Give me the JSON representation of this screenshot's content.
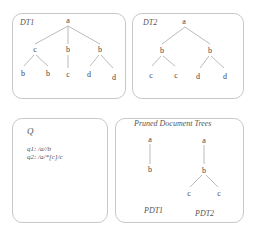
{
  "dt1": {
    "title": "DT1",
    "nodes": {
      "root": "a",
      "l": "c",
      "m": "b",
      "r": "b",
      "ll": "b",
      "lr": "b",
      "mc": "c",
      "rl": "d",
      "rr": "d"
    }
  },
  "dt2": {
    "title": "DT2",
    "nodes": {
      "root": "a",
      "l": "b",
      "r": "b",
      "ll": "c",
      "lr": "c",
      "rl": "d",
      "rr": "d"
    }
  },
  "queries": {
    "title": "Q",
    "q1": "q1:  /a//b",
    "q2": "q2:  /a/*[c]/c"
  },
  "pruned": {
    "title": "Pruned Document Trees",
    "pdt1": {
      "label": "PDT1",
      "nodes": {
        "root": "a",
        "child": "b"
      }
    },
    "pdt2": {
      "label": "PDT2",
      "nodes": {
        "root": "a",
        "child": "b",
        "ll": "c",
        "lr": "c"
      }
    }
  }
}
